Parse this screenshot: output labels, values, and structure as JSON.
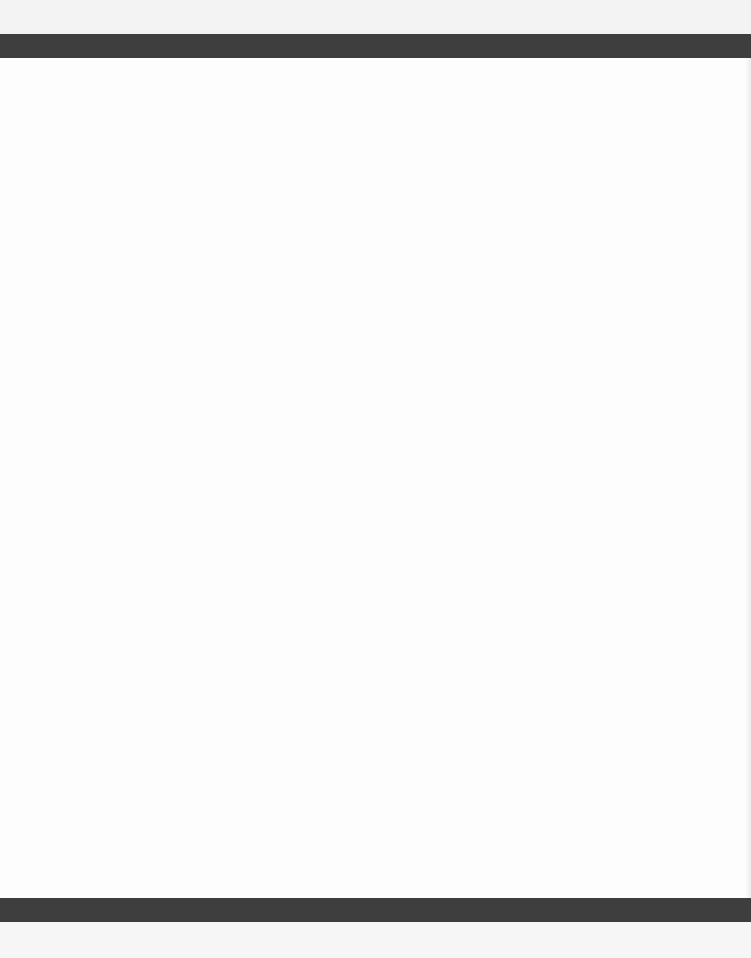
{
  "document": {
    "type": "scanned-page",
    "body_text": "",
    "colors": {
      "paper": "#fdfdfd",
      "bar": "#3e3e3e",
      "margin": "#f3f3f3"
    }
  }
}
